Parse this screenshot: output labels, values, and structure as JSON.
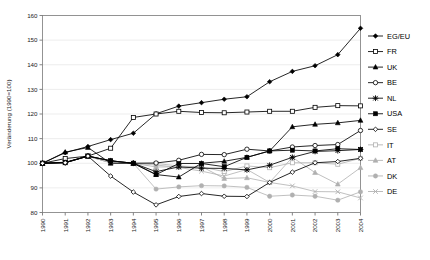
{
  "chart_data": {
    "type": "line",
    "title": "",
    "xlabel": "",
    "ylabel": "Veränderung (1990=100)",
    "ylim": [
      80,
      160
    ],
    "yticks": [
      80,
      90,
      100,
      110,
      120,
      130,
      140,
      150,
      160
    ],
    "grid": true,
    "legend_position": "right",
    "x": [
      1990,
      1991,
      1992,
      1993,
      1994,
      1995,
      1996,
      1997,
      1998,
      1999,
      2000,
      2001,
      2002,
      2003,
      2004
    ],
    "categories": [
      "1990",
      "1991",
      "1992",
      "1993",
      "1994",
      "1995",
      "1996",
      "1997",
      "1998",
      "1999",
      "2000",
      "2001",
      "2002",
      "2003",
      "2004"
    ],
    "series": [
      {
        "name": "EG/EU",
        "marker": "filled-diamond",
        "color": "#000000",
        "values": [
          100,
          104.3,
          106.8,
          109.6,
          112.2,
          120.1,
          123.2,
          124.6,
          126.0,
          127.0,
          133.1,
          137.3,
          139.6,
          144.1,
          154.8
        ]
      },
      {
        "name": "FR",
        "marker": "open-square",
        "color": "#000000",
        "values": [
          100,
          101.9,
          102.9,
          106.1,
          118.6,
          120.0,
          121.1,
          120.6,
          120.5,
          120.8,
          121.1,
          121.1,
          122.7,
          123.4,
          123.3
        ]
      },
      {
        "name": "UK",
        "marker": "filled-triangle",
        "color": "#000000",
        "values": [
          100,
          104.5,
          106.4,
          100.0,
          100.0,
          95.4,
          94.4,
          100.0,
          100.8,
          102.4,
          105.0,
          114.8,
          115.8,
          116.4,
          117.4
        ]
      },
      {
        "name": "BE",
        "marker": "open-circle",
        "color": "#000000",
        "values": [
          100,
          100.3,
          102.9,
          101.0,
          100.0,
          100.1,
          101.2,
          103.6,
          103.5,
          105.7,
          105.0,
          106.6,
          107.2,
          107.6,
          113.3
        ]
      },
      {
        "name": "NL",
        "marker": "star",
        "color": "#000000",
        "values": [
          100,
          100.2,
          102.9,
          101.0,
          100.0,
          96.6,
          98.5,
          98.0,
          97.9,
          97.3,
          99.2,
          102.4,
          104.8,
          105.1,
          105.6
        ]
      },
      {
        "name": "USA",
        "marker": "filled-square",
        "color": "#000000",
        "values": [
          100,
          100.4,
          102.9,
          101.0,
          100.0,
          95.4,
          99.9,
          99.9,
          98.6,
          102.4,
          105.0,
          105.3,
          105.0,
          105.9,
          105.6
        ]
      },
      {
        "name": "SE",
        "marker": "open-diamond",
        "color": "#000000",
        "values": [
          100,
          100.2,
          102.9,
          94.8,
          88.3,
          83.1,
          86.5,
          87.7,
          86.6,
          86.5,
          92.2,
          96.4,
          100.2,
          100.7,
          102.0
        ]
      },
      {
        "name": "IT",
        "marker": "open-square",
        "color": "#b0b0b0",
        "values": [
          100,
          100.2,
          102.9,
          100.2,
          100.0,
          99.9,
          98.9,
          98.5,
          96.6,
          98.9,
          98.2,
          100.2,
          100.2,
          99.6,
          102.0
        ]
      },
      {
        "name": "AT",
        "marker": "filled-triangle",
        "color": "#b0b0b0",
        "values": [
          100,
          100.2,
          102.9,
          100.2,
          100.0,
          98.5,
          98.5,
          98.7,
          93.8,
          94.1,
          92.2,
          102.4,
          96.2,
          91.5,
          98.2
        ]
      },
      {
        "name": "DK",
        "marker": "filled-circle",
        "color": "#b0b0b0",
        "values": [
          100,
          100.2,
          102.9,
          100.2,
          100.0,
          89.5,
          90.4,
          90.9,
          90.8,
          90.2,
          86.6,
          87.1,
          86.6,
          85.0,
          88.4
        ]
      },
      {
        "name": "DE",
        "marker": "cross",
        "color": "#b0b0b0",
        "values": [
          100,
          100.2,
          102.9,
          100.2,
          100.0,
          99.3,
          98.3,
          96.8,
          94.8,
          97.5,
          92.2,
          90.8,
          88.5,
          88.4,
          85.9
        ]
      }
    ]
  },
  "legend": {
    "items": [
      {
        "label": "EG/EU"
      },
      {
        "label": "FR"
      },
      {
        "label": "UK"
      },
      {
        "label": "BE"
      },
      {
        "label": "NL"
      },
      {
        "label": "USA"
      },
      {
        "label": "SE"
      },
      {
        "label": "IT"
      },
      {
        "label": "AT"
      },
      {
        "label": "DK"
      },
      {
        "label": "DE"
      }
    ]
  }
}
